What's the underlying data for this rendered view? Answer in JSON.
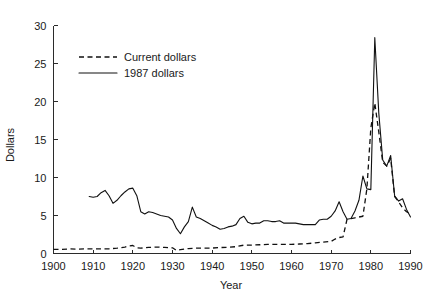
{
  "chart_data": {
    "type": "line",
    "title": "",
    "xlabel": "Year",
    "ylabel": "Dollars",
    "xlim": [
      1900,
      1990
    ],
    "ylim": [
      0,
      30
    ],
    "xticks": [
      1900,
      1910,
      1920,
      1930,
      1940,
      1950,
      1960,
      1970,
      1980,
      1990
    ],
    "yticks": [
      0,
      5,
      10,
      15,
      20,
      25,
      30
    ],
    "xtick_labels": [
      "1900",
      "1910",
      "1920",
      "1930",
      "1940",
      "1950",
      "1960",
      "1970",
      "1980",
      "1990"
    ],
    "ytick_labels": [
      "0",
      "5",
      "10",
      "15",
      "20",
      "25",
      "30"
    ],
    "grid": false,
    "legend_position": "upper-left",
    "series": [
      {
        "name": "Current dollars",
        "style": "dashed",
        "color": "#111111",
        "x": [
          1900,
          1902,
          1904,
          1906,
          1908,
          1910,
          1912,
          1914,
          1916,
          1918,
          1919,
          1920,
          1921,
          1922,
          1924,
          1926,
          1928,
          1930,
          1931,
          1932,
          1934,
          1936,
          1938,
          1940,
          1942,
          1944,
          1946,
          1948,
          1950,
          1952,
          1954,
          1956,
          1958,
          1960,
          1962,
          1964,
          1966,
          1968,
          1970,
          1971,
          1972,
          1973,
          1974,
          1975,
          1976,
          1977,
          1978,
          1979,
          1980,
          1981,
          1982,
          1983,
          1984,
          1985,
          1986,
          1987,
          1988,
          1989,
          1990
        ],
        "y": [
          0.55,
          0.55,
          0.6,
          0.58,
          0.6,
          0.6,
          0.62,
          0.62,
          0.7,
          0.85,
          1.0,
          1.05,
          0.75,
          0.7,
          0.8,
          0.85,
          0.8,
          0.75,
          0.4,
          0.5,
          0.65,
          0.7,
          0.72,
          0.72,
          0.78,
          0.82,
          0.9,
          1.1,
          1.1,
          1.15,
          1.2,
          1.2,
          1.2,
          1.2,
          1.25,
          1.3,
          1.4,
          1.5,
          1.6,
          1.9,
          2.1,
          2.2,
          4.5,
          4.6,
          4.7,
          4.8,
          4.9,
          8.5,
          16.5,
          19.8,
          16.0,
          12.0,
          11.5,
          12.5,
          7.5,
          6.8,
          6.0,
          5.5,
          5.2
        ]
      },
      {
        "name": "1987 dollars",
        "style": "solid",
        "color": "#111111",
        "x": [
          1909,
          1910,
          1911,
          1912,
          1913,
          1914,
          1915,
          1916,
          1917,
          1918,
          1919,
          1920,
          1921,
          1922,
          1923,
          1924,
          1925,
          1926,
          1927,
          1928,
          1929,
          1930,
          1931,
          1932,
          1933,
          1934,
          1935,
          1936,
          1937,
          1938,
          1939,
          1940,
          1941,
          1942,
          1943,
          1944,
          1945,
          1946,
          1947,
          1948,
          1949,
          1950,
          1951,
          1952,
          1953,
          1954,
          1955,
          1956,
          1957,
          1958,
          1959,
          1960,
          1961,
          1962,
          1963,
          1964,
          1965,
          1966,
          1967,
          1968,
          1969,
          1970,
          1971,
          1972,
          1973,
          1974,
          1975,
          1976,
          1977,
          1978,
          1979,
          1980,
          1981,
          1982,
          1983,
          1984,
          1985,
          1986,
          1987,
          1988,
          1989,
          1990
        ],
        "y": [
          7.5,
          7.4,
          7.5,
          8.0,
          8.3,
          7.6,
          6.6,
          7.0,
          7.6,
          8.1,
          8.5,
          8.6,
          7.6,
          5.5,
          5.2,
          5.5,
          5.4,
          5.2,
          5.0,
          4.9,
          4.8,
          4.4,
          3.3,
          2.6,
          3.5,
          4.2,
          6.1,
          4.8,
          4.6,
          4.3,
          4.0,
          3.7,
          3.5,
          3.2,
          3.3,
          3.5,
          3.6,
          3.8,
          4.6,
          4.9,
          4.1,
          3.9,
          4.0,
          4.0,
          4.3,
          4.3,
          4.2,
          4.2,
          4.3,
          4.0,
          4.0,
          4.0,
          4.0,
          3.9,
          3.8,
          3.8,
          3.8,
          3.8,
          4.4,
          4.5,
          4.5,
          4.9,
          5.6,
          6.8,
          5.5,
          4.5,
          4.6,
          5.6,
          7.0,
          10.2,
          8.5,
          8.4,
          28.4,
          18.5,
          12.3,
          11.5,
          12.9,
          7.6,
          6.9,
          7.2,
          5.8,
          4.8
        ]
      }
    ],
    "annotations": []
  },
  "legend": {
    "items": [
      {
        "label": "Current dollars",
        "style": "dashed"
      },
      {
        "label": "1987 dollars",
        "style": "solid"
      }
    ]
  },
  "axes": {
    "x_title": "Year",
    "y_title": "Dollars"
  }
}
